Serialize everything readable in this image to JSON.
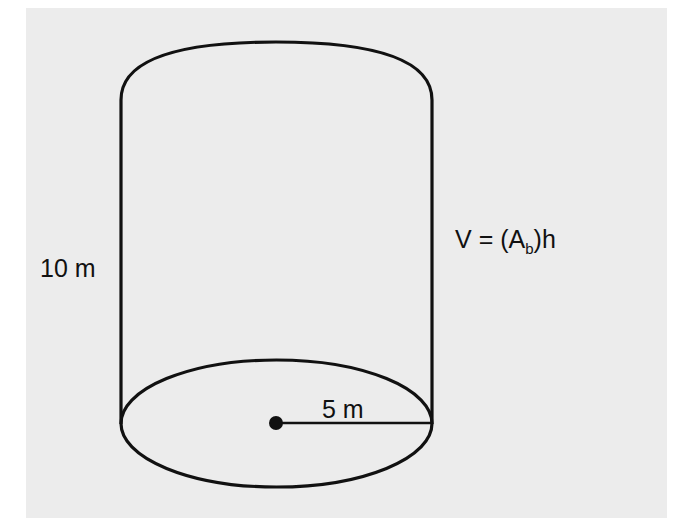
{
  "figure": {
    "type": "cylinder",
    "background_color": "#ececec",
    "stroke_color": "#111111",
    "height_label": "10 m",
    "radius_label": "5 m",
    "formula": {
      "lhs": "V",
      "equals": "=",
      "open": "(",
      "base": "A",
      "subscript": "b",
      "close": ")",
      "factor": "h"
    }
  }
}
